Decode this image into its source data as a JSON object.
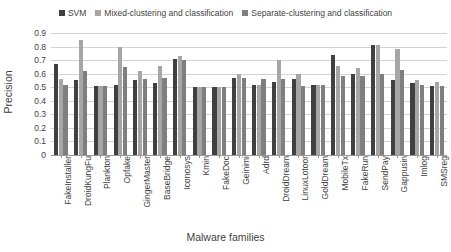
{
  "chart_data": {
    "type": "bar",
    "title": "",
    "xlabel": "Malware families",
    "ylabel": "Precision",
    "ylim": [
      0,
      0.9
    ],
    "ytick_labels": [
      "0.9",
      "0.8",
      "0.7",
      "0.6",
      "0.5",
      "0.4",
      "0.3",
      "0.2",
      "0.1",
      "0"
    ],
    "ytick_values": [
      0.9,
      0.8,
      0.7,
      0.6,
      0.5,
      0.4,
      0.3,
      0.2,
      0.1,
      0
    ],
    "grid": true,
    "legend_position": "top-center",
    "categories": [
      "FakeInstaller",
      "DroidKungFu",
      "Plankton",
      "Opfake",
      "GingerMaster",
      "BaseBridge",
      "Iconosys",
      "Kmin",
      "FakeDoc",
      "Geinimi",
      "Adrd",
      "DroidDream",
      "LinuxLotoor",
      "GoldDream",
      "MobileTx",
      "FakeRun",
      "SendPay",
      "Gappusin",
      "Imlog",
      "SMSreg"
    ],
    "series": [
      {
        "name": "SVM",
        "color": "#404040",
        "values": [
          0.67,
          0.55,
          0.51,
          0.52,
          0.55,
          0.53,
          0.71,
          0.5,
          0.5,
          0.57,
          0.52,
          0.54,
          0.56,
          0.52,
          0.74,
          0.6,
          0.81,
          0.55,
          0.53,
          0.51
        ]
      },
      {
        "name": "Mixed-clustering and classification",
        "color": "#a6a6a6",
        "values": [
          0.56,
          0.85,
          0.51,
          0.8,
          0.62,
          0.66,
          0.73,
          0.5,
          0.5,
          0.6,
          0.52,
          0.7,
          0.6,
          0.52,
          0.66,
          0.64,
          0.81,
          0.78,
          0.55,
          0.54
        ]
      },
      {
        "name": "Separate-clustering and classification",
        "color": "#7f7f7f",
        "values": [
          0.52,
          0.62,
          0.51,
          0.65,
          0.56,
          0.57,
          0.7,
          0.5,
          0.5,
          0.57,
          0.56,
          0.56,
          0.51,
          0.52,
          0.58,
          0.58,
          0.6,
          0.63,
          0.52,
          0.51
        ]
      }
    ]
  },
  "legend": {
    "entries": [
      {
        "label": "SVM"
      },
      {
        "label": "Mixed-clustering and classification"
      },
      {
        "label": "Separate-clustering and classification"
      }
    ]
  }
}
